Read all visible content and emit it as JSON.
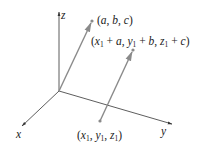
{
  "figure": {
    "type": "3d-vector-diagram",
    "axes": {
      "x": {
        "label": "x"
      },
      "y": {
        "label": "y"
      },
      "z": {
        "label": "z"
      }
    },
    "points": {
      "tip_a": {
        "label": "(a, b, c)"
      },
      "start_b": {
        "label": "(x1, y1, z1)"
      },
      "tip_b": {
        "label": "(x1 + a, y1 + b, z1 + c)"
      }
    },
    "colors": {
      "axis": "#333333",
      "vector": "#8a8a8a",
      "text": "#222222"
    }
  }
}
